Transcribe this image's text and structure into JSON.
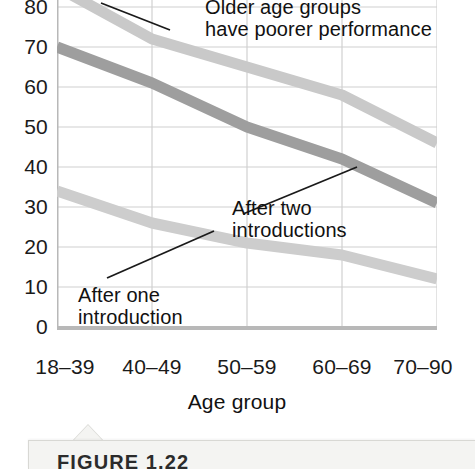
{
  "chart_data": {
    "type": "line",
    "title": "",
    "xlabel": "Age group",
    "ylabel": "",
    "categories": [
      "18–39",
      "40–49",
      "50–59",
      "60–69",
      "70–90"
    ],
    "ylim": [
      0,
      85
    ],
    "ytick_values": [
      0,
      10,
      20,
      30,
      40,
      50,
      60,
      70,
      80
    ],
    "ytick_labels": [
      "0",
      "10",
      "20",
      "30",
      "40",
      "50",
      "60",
      "70",
      "80"
    ],
    "grid": "both",
    "legend": "none",
    "series": [
      {
        "name": "After three or more introductions",
        "values": [
          85,
          72,
          65,
          58,
          46
        ],
        "color": "#c9c9c9"
      },
      {
        "name": "After two introductions",
        "values": [
          70,
          61,
          50,
          42,
          31
        ],
        "color": "#9e9e9e"
      },
      {
        "name": "After one introduction",
        "values": [
          34,
          26,
          21,
          18,
          12
        ],
        "color": "#cdcdcd"
      }
    ],
    "annotations": [
      {
        "id": "older-age-groups",
        "text": "Older age groups\nhave poorer performance"
      },
      {
        "id": "after-two",
        "text": "After two\nintroductions"
      },
      {
        "id": "after-one",
        "text": "After one\nintroduction"
      }
    ]
  },
  "caption": {
    "label": "FIGURE 1.22"
  },
  "colors": {
    "grid": "#d0d0d0",
    "axis": "#b8b8b8",
    "text": "#111111",
    "leader": "#1a1a1a",
    "caption_bg": "#f4f4f2"
  }
}
